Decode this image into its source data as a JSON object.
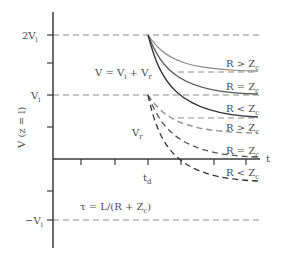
{
  "diagram": {
    "y_axis_label": "V (z = l)",
    "x_axis_label": "t",
    "y_ticks": [
      {
        "label": "2V",
        "sub": "i",
        "prefix": ""
      },
      {
        "label": "V",
        "sub": "i",
        "prefix": ""
      },
      {
        "label": "V",
        "sub": "i",
        "prefix": "−"
      }
    ],
    "x_tick_label": {
      "main": "t",
      "sub": "d"
    },
    "equation_total": {
      "main": "V = V",
      "sub1": "i",
      "mid": " + V",
      "sub2": "r"
    },
    "reflected_label": {
      "main": "V",
      "sub": "r"
    },
    "time_constant": {
      "main": "τ = L/(R + Z",
      "sub": "c",
      "end": ")"
    },
    "solid_curves": [
      {
        "label": "R > Z",
        "sub": "c"
      },
      {
        "label": "R = Z",
        "sub": "c"
      },
      {
        "label": "R < Z",
        "sub": "c"
      }
    ],
    "dashed_curves": [
      {
        "label": "R > Z",
        "sub": "c"
      },
      {
        "label": "R = Z",
        "sub": "c"
      },
      {
        "label": "R < Z",
        "sub": "c"
      }
    ],
    "colors": {
      "axis": "#3a3a3a",
      "curve": "#444444",
      "dashed_ref": "#8a8a8a"
    }
  }
}
